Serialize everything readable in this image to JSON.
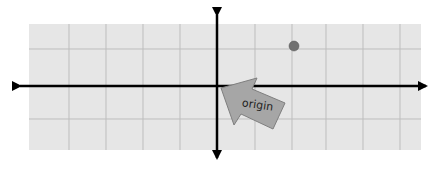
{
  "diagram": {
    "type": "coordinate-plane",
    "grid": {
      "x_min": 29,
      "x_max": 421,
      "y_min": 24,
      "y_max": 150,
      "vertical_lines": [
        69,
        106,
        143,
        180,
        255,
        292,
        326,
        363,
        400
      ],
      "horizontal_lines": [
        49,
        119
      ],
      "fill": "#e6e6e6",
      "line_color": "#bdbdbd"
    },
    "axes": {
      "x_axis_y": 86,
      "x_axis_from": 12,
      "x_axis_to": 434,
      "y_axis_x": 217,
      "y_axis_from": 7,
      "y_axis_to": 166,
      "color": "#000000"
    },
    "point": {
      "cx": 294,
      "cy": 46,
      "r": 5,
      "color": "#707070"
    },
    "callout": {
      "label": "origin",
      "fill": "#a6a6a6",
      "stroke": "#7f7f7f",
      "points": "221,88 257,78 252,89 285,103 273,129 241,114 234,125"
    }
  }
}
